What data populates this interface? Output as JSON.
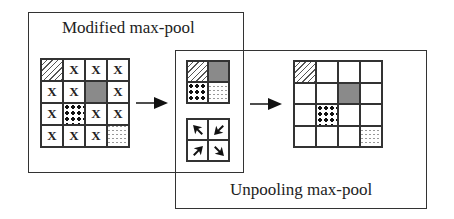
{
  "diagram": {
    "left_panel": {
      "title": "Modified max-pool",
      "grid": [
        [
          "hatch",
          "x",
          "x",
          "x"
        ],
        [
          "x",
          "x",
          "gray",
          "x"
        ],
        [
          "x",
          "dots",
          "x",
          "x"
        ],
        [
          "x",
          "x",
          "x",
          "dash"
        ]
      ],
      "x_mark": "X"
    },
    "right_panel": {
      "title": "Unpooling max-pool",
      "pooled_grid": [
        [
          "hatch",
          "gray"
        ],
        [
          "dots",
          "dash"
        ]
      ],
      "switch_grid": [
        [
          "arrow-up-left",
          "arrow-down-left"
        ],
        [
          "arrow-up-right",
          "arrow-down-right"
        ]
      ],
      "output_grid": [
        [
          "hatch",
          "",
          "",
          ""
        ],
        [
          "",
          "",
          "gray",
          ""
        ],
        [
          "",
          "dots",
          "",
          ""
        ],
        [
          "",
          "",
          "",
          "dash"
        ]
      ]
    },
    "arrows": [
      "right-arrow",
      "right-arrow"
    ]
  }
}
